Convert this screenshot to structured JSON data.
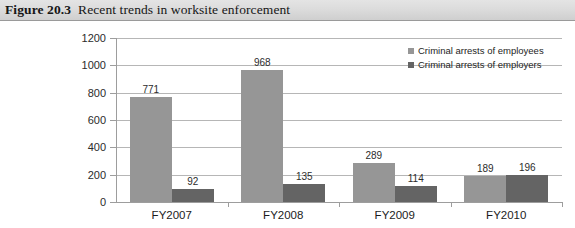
{
  "caption": {
    "label": "Figure 20.3",
    "title": "Recent trends in worksite enforcement"
  },
  "chart_data": {
    "type": "bar",
    "title": "Recent trends in worksite enforcement",
    "xlabel": "",
    "ylabel": "",
    "ylim": [
      0,
      1200
    ],
    "yticks": [
      0,
      200,
      400,
      600,
      800,
      1000,
      1200
    ],
    "ytick_labels": [
      "0",
      "200",
      "400",
      "600",
      "800",
      "1000",
      "1200"
    ],
    "grid": true,
    "legend_position": "top-right",
    "categories": [
      "FY2007",
      "FY2008",
      "FY2009",
      "FY2010"
    ],
    "series": [
      {
        "name": "Criminal arrests of employees",
        "color": "#969696",
        "values": [
          771,
          968,
          289,
          189
        ]
      },
      {
        "name": "Criminal arrests of employers",
        "color": "#646464",
        "values": [
          92,
          135,
          114,
          196
        ]
      }
    ],
    "data_labels": [
      [
        "771",
        "92"
      ],
      [
        "968",
        "135"
      ],
      [
        "289",
        "114"
      ],
      [
        "189",
        "196"
      ]
    ]
  },
  "colors": {
    "employees": "#969696",
    "employers": "#646464",
    "gridline": "#b6b6b6",
    "axis": "#9d9d9d",
    "caption_band": "#dcdcdc"
  }
}
